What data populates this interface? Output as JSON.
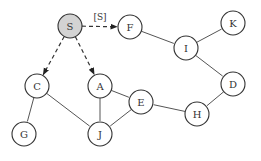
{
  "diagram": {
    "type": "graph",
    "colors": {
      "start_fill": "#d3d3d3",
      "node_fill": "#ffffff",
      "stroke": "#333333"
    },
    "nodes": [
      {
        "id": "S",
        "label": "S",
        "x": 70,
        "y": 26,
        "highlight": true
      },
      {
        "id": "F",
        "label": "F",
        "x": 130,
        "y": 27
      },
      {
        "id": "I",
        "label": "I",
        "x": 186,
        "y": 48
      },
      {
        "id": "K",
        "label": "K",
        "x": 233,
        "y": 23
      },
      {
        "id": "D",
        "label": "D",
        "x": 233,
        "y": 84
      },
      {
        "id": "H",
        "label": "H",
        "x": 197,
        "y": 114
      },
      {
        "id": "E",
        "label": "E",
        "x": 141,
        "y": 102
      },
      {
        "id": "A",
        "label": "A",
        "x": 100,
        "y": 86
      },
      {
        "id": "J",
        "label": "J",
        "x": 100,
        "y": 134
      },
      {
        "id": "C",
        "label": "C",
        "x": 37,
        "y": 86
      },
      {
        "id": "G",
        "label": "G",
        "x": 24,
        "y": 134
      }
    ],
    "edges": [
      {
        "from": "S",
        "to": "F",
        "style": "dashed-arrow",
        "label": "[S]"
      },
      {
        "from": "S",
        "to": "C",
        "style": "dashed-arrow"
      },
      {
        "from": "S",
        "to": "A",
        "style": "dashed-arrow"
      },
      {
        "from": "F",
        "to": "I",
        "style": "solid"
      },
      {
        "from": "I",
        "to": "K",
        "style": "solid"
      },
      {
        "from": "I",
        "to": "D",
        "style": "solid"
      },
      {
        "from": "D",
        "to": "H",
        "style": "solid"
      },
      {
        "from": "H",
        "to": "E",
        "style": "solid"
      },
      {
        "from": "A",
        "to": "E",
        "style": "solid"
      },
      {
        "from": "A",
        "to": "J",
        "style": "solid"
      },
      {
        "from": "E",
        "to": "J",
        "style": "solid"
      },
      {
        "from": "C",
        "to": "J",
        "style": "solid"
      },
      {
        "from": "C",
        "to": "G",
        "style": "solid"
      }
    ]
  }
}
